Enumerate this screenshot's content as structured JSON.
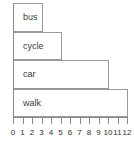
{
  "chart_data": {
    "type": "bar",
    "orientation": "horizontal",
    "title": "",
    "subtitle": "",
    "xlabel": "",
    "ylabel": "",
    "categories": [
      "bus",
      "cycle",
      "car",
      "walk"
    ],
    "values": [
      3,
      5,
      10,
      12
    ],
    "series": [
      {
        "name": "",
        "values": [
          3,
          5,
          10,
          12
        ]
      }
    ],
    "xlim": [
      0,
      12
    ],
    "ylim": [
      0,
      4
    ],
    "x_ticks": [
      0,
      1,
      2,
      3,
      4,
      5,
      6,
      7,
      8,
      9,
      10,
      11,
      12
    ],
    "x_tick_labels": [
      "0",
      "1",
      "2",
      "3",
      "4",
      "5",
      "6",
      "7",
      "8",
      "9",
      "10",
      "11",
      "12"
    ],
    "y_ticks": [],
    "y_tick_labels": [],
    "grid": false,
    "legend": null,
    "legend_position": "none",
    "annotations": [],
    "bar_labels_inside": true,
    "colors": {
      "bar_fill": "transparent",
      "bar_stroke": "#9a9a9a",
      "axis": "#8a8a8a",
      "text": "#2e2e2e",
      "label_text": "#3b3b3b",
      "background": "#ffffff"
    }
  },
  "bars": [
    {
      "label": "bus",
      "value": 3,
      "index": 0
    },
    {
      "label": "cycle",
      "value": 5,
      "index": 1
    },
    {
      "label": "car",
      "value": 10,
      "index": 2
    },
    {
      "label": "walk",
      "value": 12,
      "index": 3
    }
  ],
  "axis": {
    "tick_labels": [
      "0",
      "1",
      "2",
      "3",
      "4",
      "5",
      "6",
      "7",
      "8",
      "9",
      "10",
      "11",
      "12"
    ]
  }
}
